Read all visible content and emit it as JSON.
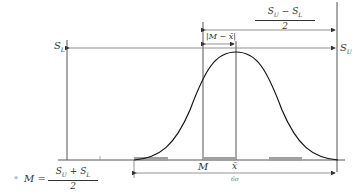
{
  "diagram": {
    "labels": {
      "lower_spec": {
        "sym": "S",
        "sub": "L"
      },
      "upper_spec": {
        "sym": "S",
        "sub": "U"
      },
      "midpoint": "M",
      "mean": "x̄",
      "six_sigma": "6σ",
      "offset": "|M − x̄|",
      "half_tolerance": {
        "num_a": "S",
        "num_a_sub": "U",
        "op": " − ",
        "num_b": "S",
        "num_b_sub": "L",
        "den": "2"
      },
      "footnote": {
        "bullet": "*",
        "lhs": "M =",
        "num_a": "S",
        "num_a_sub": "U",
        "op": " + ",
        "num_b": "S",
        "num_b_sub": "L",
        "den": "2"
      }
    },
    "colors": {
      "line": "#333333",
      "curve": "#111111",
      "shade": "#a0a0a0"
    }
  }
}
